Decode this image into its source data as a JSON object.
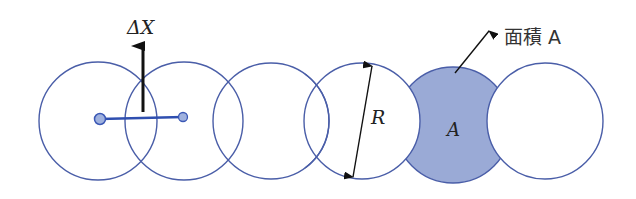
{
  "diagram": {
    "labels": {
      "delta_x": "ΔX",
      "radius": "R",
      "area_inner": "A",
      "area_callout": "面積 A"
    },
    "colors": {
      "circle_stroke": "#4a5ea8",
      "shaded_fill": "#9aaad6",
      "bond_line": "#2f4fb0",
      "dot_fill": "#9fb1de",
      "arrow": "#111111"
    },
    "circles": [
      {
        "cx": 98,
        "cy": 121,
        "r": 59,
        "shaded": false
      },
      {
        "cx": 184,
        "cy": 121,
        "r": 59,
        "shaded": false
      },
      {
        "cx": 271,
        "cy": 121,
        "r": 58,
        "shaded": false
      },
      {
        "cx": 362,
        "cy": 121,
        "r": 58,
        "shaded": false
      },
      {
        "cx": 453,
        "cy": 125,
        "r": 58,
        "shaded": true
      },
      {
        "cx": 545,
        "cy": 121,
        "r": 58,
        "shaded": false
      }
    ]
  }
}
